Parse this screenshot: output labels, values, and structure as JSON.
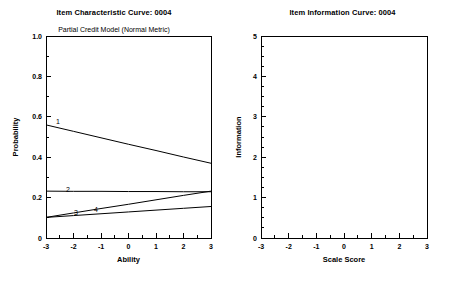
{
  "panels": [
    {
      "id": "icc",
      "title": "Item Characteristic Curve: 0004",
      "subtitle": "Partial Credit Model (Normal Metric)",
      "xlabel": "Ability",
      "ylabel": "Probability",
      "xticks": [
        "-3",
        "-2",
        "-1",
        "0",
        "1",
        "2",
        "3"
      ],
      "yticks": [
        "0",
        "0.2",
        "0.4",
        "0.6",
        "0.8",
        "1.0"
      ],
      "curve_labels": [
        "1",
        "2",
        "3",
        "4"
      ]
    },
    {
      "id": "iic",
      "title": "Item Information Curve: 0004",
      "subtitle": "",
      "xlabel": "Scale Score",
      "ylabel": "Information",
      "xticks": [
        "-3",
        "-2",
        "-1",
        "0",
        "1",
        "2",
        "3"
      ],
      "yticks": [
        "0",
        "1",
        "2",
        "3",
        "4",
        "5"
      ],
      "curve_labels": []
    }
  ],
  "chart_data": [
    {
      "type": "line",
      "title": "Item Characteristic Curve: 0004",
      "subtitle": "Partial Credit Model (Normal Metric)",
      "xlabel": "Ability",
      "ylabel": "Probability",
      "xlim": [
        -3,
        3
      ],
      "ylim": [
        0,
        1.0
      ],
      "xticks": [
        -3,
        -2,
        -1,
        0,
        1,
        2,
        3
      ],
      "yticks": [
        0,
        0.2,
        0.4,
        0.6,
        0.8,
        1.0
      ],
      "grid": false,
      "legend": "inline-curve-labels",
      "x": [
        -3,
        -2,
        -1,
        0,
        1,
        2,
        3
      ],
      "series": [
        {
          "name": "1",
          "values": [
            0.56,
            0.528,
            0.496,
            0.464,
            0.433,
            0.401,
            0.37
          ]
        },
        {
          "name": "2",
          "values": [
            0.232,
            0.231,
            0.231,
            0.23,
            0.23,
            0.229,
            0.229
          ]
        },
        {
          "name": "3",
          "values": [
            0.102,
            0.111,
            0.12,
            0.129,
            0.138,
            0.147,
            0.156
          ]
        },
        {
          "name": "4",
          "values": [
            0.102,
            0.124,
            0.146,
            0.167,
            0.189,
            0.211,
            0.232
          ]
        }
      ],
      "annotations": [
        {
          "text": "1",
          "x": -2.55,
          "y": 0.6
        },
        {
          "text": "2",
          "x": -2.2,
          "y": 0.272
        },
        {
          "text": "3",
          "x": -1.9,
          "y": 0.167
        },
        {
          "text": "4",
          "x": -1.1,
          "y": 0.182
        }
      ]
    },
    {
      "type": "line",
      "title": "Item Information Curve: 0004",
      "subtitle": "",
      "xlabel": "Scale Score",
      "ylabel": "Information",
      "xlim": [
        -3,
        3
      ],
      "ylim": [
        0,
        5
      ],
      "xticks": [
        -3,
        -2,
        -1,
        0,
        1,
        2,
        3
      ],
      "yticks": [
        0,
        1,
        2,
        3,
        4,
        5
      ],
      "grid": false,
      "legend": "none",
      "x": [],
      "series": []
    }
  ],
  "colors": {
    "background": "#ffffff",
    "axis": "#000000",
    "curve": "#000000",
    "text": "#000000"
  }
}
